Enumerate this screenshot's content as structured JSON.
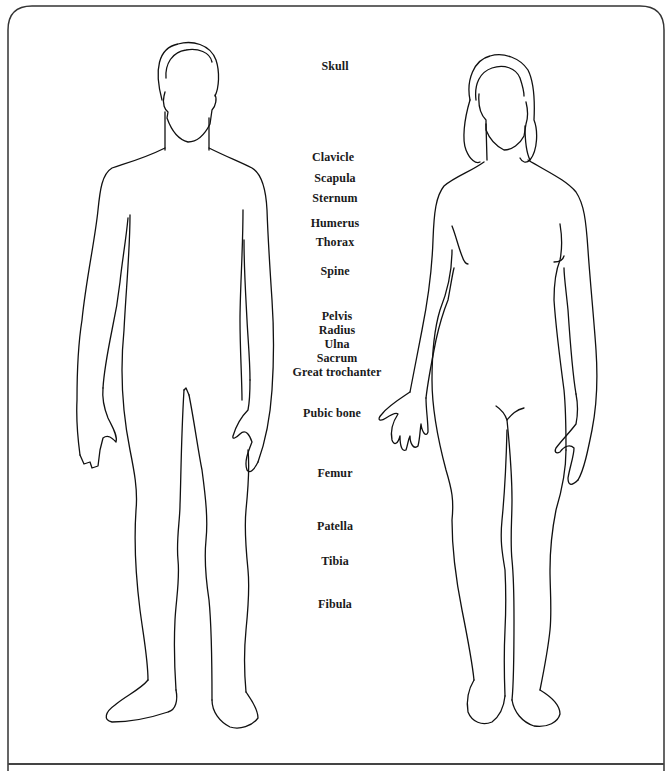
{
  "diagram": {
    "type": "anatomical-body-outline",
    "figures": [
      {
        "id": "male",
        "description": "Front view outline of a male body"
      },
      {
        "id": "female",
        "description": "Front view outline of a female body"
      }
    ],
    "labels": [
      {
        "text": "Skull",
        "y": 66
      },
      {
        "text": "Clavicle",
        "y": 150
      },
      {
        "text": "Scapula",
        "y": 172
      },
      {
        "text": "Sternum",
        "y": 192
      },
      {
        "text": "Humerus",
        "y": 217
      },
      {
        "text": "Thorax",
        "y": 236
      },
      {
        "text": "Spine",
        "y": 265
      },
      {
        "text": "Pelvis",
        "y": 310
      },
      {
        "text": "Radius",
        "y": 324
      },
      {
        "text": "Ulna",
        "y": 338
      },
      {
        "text": "Sacrum",
        "y": 352
      },
      {
        "text": "Great trochanter",
        "y": 366
      },
      {
        "text": "Pubic bone",
        "y": 407
      },
      {
        "text": "Femur",
        "y": 467
      },
      {
        "text": "Patella",
        "y": 520
      },
      {
        "text": "Tibia",
        "y": 555
      },
      {
        "text": "Fibula",
        "y": 598
      }
    ],
    "colors": {
      "line": "#111111",
      "text": "#1a1a1a",
      "background": "#ffffff"
    }
  }
}
